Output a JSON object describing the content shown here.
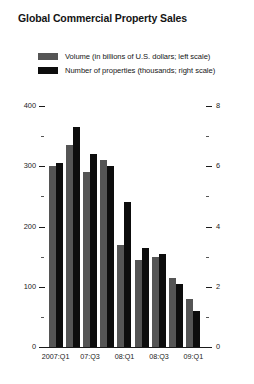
{
  "chart_data": {
    "type": "bar",
    "title": "Global Commercial Property Sales",
    "xlabel": "",
    "ylabel": "",
    "grid": false,
    "legend_position": "top-left",
    "categories": [
      "2007:Q1",
      "07:Q2",
      "07:Q3",
      "07:Q4",
      "08:Q1",
      "08:Q2",
      "08:Q3",
      "08:Q4",
      "09:Q1"
    ],
    "tick_labels": [
      "2007:Q1",
      "",
      "07:Q3",
      "",
      "08:Q1",
      "",
      "08:Q3",
      "",
      "09:Q1"
    ],
    "series": [
      {
        "name": "Volume (in billions of U.S. dollars; left scale)",
        "axis": "left",
        "color": "#555555",
        "values": [
          300,
          335,
          290,
          310,
          170,
          145,
          150,
          115,
          80
        ]
      },
      {
        "name": "Number of properties (thousands; right scale)",
        "axis": "right",
        "color": "#0d0d0d",
        "values": [
          6.1,
          7.3,
          6.4,
          6.0,
          4.8,
          3.3,
          3.1,
          2.1,
          1.2
        ]
      }
    ],
    "left_axis": {
      "ticks": [
        0,
        100,
        200,
        300,
        400
      ],
      "minor_ticks": [
        50,
        150,
        250,
        350
      ],
      "ylim": [
        0,
        400
      ],
      "labels": [
        "0",
        "100",
        "200",
        "300",
        "400"
      ]
    },
    "right_axis": {
      "ticks": [
        0,
        2,
        4,
        6,
        8
      ],
      "minor_ticks": [
        1,
        3,
        5,
        7
      ],
      "ylim": [
        0,
        8
      ],
      "labels": [
        "0",
        "2",
        "4",
        "6",
        "8"
      ]
    }
  },
  "legend": {
    "items": [
      {
        "label": "Volume (in billions of U.S. dollars; left scale)",
        "color": "#555555"
      },
      {
        "label": "Number of properties (thousands; right scale)",
        "color": "#0d0d0d"
      }
    ]
  }
}
